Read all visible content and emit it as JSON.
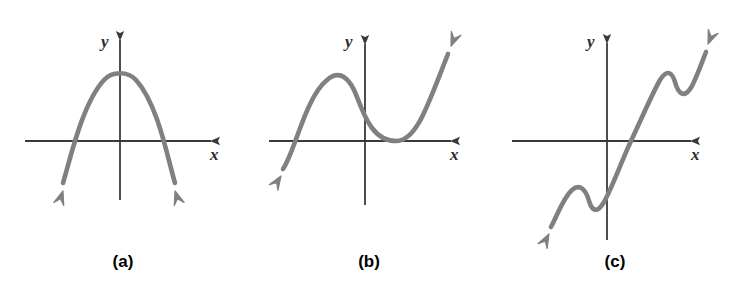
{
  "figure": {
    "background_color": "#ffffff",
    "curve_color": "#808080",
    "axis_color": "#3a3a3a",
    "caption_color": "#000000",
    "curve_width": 4.6,
    "axis_width": 1.8
  },
  "panels": [
    {
      "id": "a",
      "caption": "(a)",
      "x_axis_label": "x",
      "y_axis_label": "y",
      "shape": "downward parabola",
      "origin": {
        "x": 120,
        "y": 141
      },
      "x_axis": {
        "x1": 25,
        "x2": 218,
        "y": 141
      },
      "y_axis": {
        "x": 120,
        "y1": 33,
        "y2": 200
      },
      "curve_path": "M 63 183 C 70 160 82 104 104 80 C 112 71 128 71 136 80 C 158 104 168 160 175 183",
      "arrows": [
        {
          "name": "curve-arrow-left-down",
          "tip": {
            "x": 63,
            "y": 191
          },
          "angle": 108
        },
        {
          "name": "curve-arrow-right-down",
          "tip": {
            "x": 175,
            "y": 191
          },
          "angle": 72
        }
      ],
      "x_label_pos": {
        "x": 210,
        "y": 160
      },
      "y_label_pos": {
        "x": 101,
        "y": 47
      }
    },
    {
      "id": "b",
      "caption": "(b)",
      "x_axis_label": "x",
      "y_axis_label": "y",
      "shape": "cubic, positive leading coefficient, double root right of origin",
      "origin": {
        "x": 365,
        "y": 141
      },
      "x_axis": {
        "x1": 269,
        "x2": 458,
        "y": 141
      },
      "y_axis": {
        "x": 365,
        "y1": 37,
        "y2": 205
      },
      "curve_path": "M 283 169 C 295 152 305 98 327 80 C 340 69 350 78 357 97 C 366 121 375 141 396 141 C 417 141 428 104 448 54",
      "arrows": [
        {
          "name": "curve-arrow-left-down",
          "tip": {
            "x": 281,
            "y": 176
          },
          "angle": 123
        },
        {
          "name": "curve-arrow-right-up",
          "tip": {
            "x": 451,
            "y": 46
          },
          "angle": -68
        }
      ],
      "x_label_pos": {
        "x": 450,
        "y": 160
      },
      "y_label_pos": {
        "x": 345,
        "y": 47
      }
    },
    {
      "id": "c",
      "caption": "(c)",
      "x_axis_label": "x",
      "y_axis_label": "y",
      "shape": "odd degree with two wiggles, symmetric about origin",
      "origin": {
        "x": 607,
        "y": 141
      },
      "x_axis": {
        "x1": 512,
        "x2": 698,
        "y": 141
      },
      "y_axis": {
        "x": 607,
        "y1": 36,
        "y2": 240
      },
      "curve_path": "M 551 227 C 558 214 563 198 572 190 C 580 183 586 190 589 201 C 592 211 597 214 604 202 C 612 188 622 160 631 141 C 640 122 652 94 660 80 C 667 69 672 72 675 82 C 678 93 684 100 692 86 C 698 74 702 62 706 52",
      "arrows": [
        {
          "name": "curve-arrow-left-down",
          "tip": {
            "x": 549,
            "y": 234
          },
          "angle": 118
        },
        {
          "name": "curve-arrow-right-up",
          "tip": {
            "x": 708,
            "y": 44
          },
          "angle": -68
        }
      ],
      "x_label_pos": {
        "x": 691,
        "y": 160
      },
      "y_label_pos": {
        "x": 587,
        "y": 47
      }
    }
  ]
}
